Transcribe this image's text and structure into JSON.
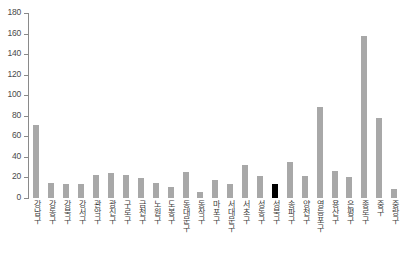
{
  "chart_data": {
    "type": "bar",
    "title": "",
    "xlabel": "",
    "ylabel": "",
    "ylim": [
      0,
      180
    ],
    "ytick_values": [
      180,
      160,
      140,
      120,
      100,
      80,
      60,
      40,
      20,
      0
    ],
    "ytick_labels": [
      "180",
      "160",
      "140",
      "120",
      "100",
      "80",
      "60",
      "40",
      "20",
      "0"
    ],
    "grid": false,
    "legend": "none",
    "bar_color": "#a8a8a8",
    "highlight_color": "#000000",
    "highlight_category": "성북구",
    "categories": [
      "강남구",
      "강동구",
      "강북구",
      "강서구",
      "관악구",
      "광진구",
      "구로구",
      "금천구",
      "노원구",
      "도봉구",
      "동대문구",
      "동작구",
      "마포구",
      "서대문구",
      "서초구",
      "성동구",
      "성북구",
      "송파구",
      "양천구",
      "영등포구",
      "용산구",
      "은평구",
      "종로구",
      "중구",
      "중랑구"
    ],
    "values": [
      71,
      15,
      14,
      14,
      22,
      24,
      22,
      19,
      15,
      11,
      25,
      6,
      18,
      14,
      32,
      21,
      14,
      35,
      21,
      89,
      26,
      20,
      158,
      78,
      9
    ],
    "highlights": [
      false,
      false,
      false,
      false,
      false,
      false,
      false,
      false,
      false,
      false,
      false,
      false,
      false,
      false,
      false,
      false,
      true,
      false,
      false,
      false,
      false,
      false,
      false,
      false,
      false
    ]
  }
}
